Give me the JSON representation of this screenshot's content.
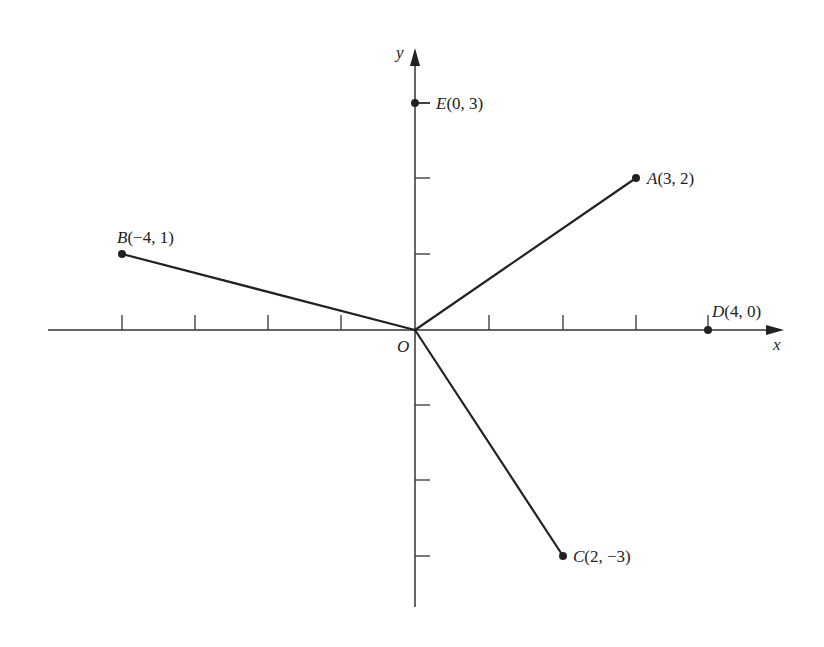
{
  "axes": {
    "x_label": "x",
    "y_label": "y",
    "origin_label": "O"
  },
  "points": [
    {
      "name": "E",
      "x": 0,
      "y": 3,
      "label": "E",
      "coords": "(0, 3)"
    },
    {
      "name": "A",
      "x": 3,
      "y": 2,
      "label": "A",
      "coords": "(3, 2)"
    },
    {
      "name": "B",
      "x": -4,
      "y": 1,
      "label": "B",
      "coords": "(−4, 1)"
    },
    {
      "name": "D",
      "x": 4,
      "y": 0,
      "label": "D",
      "coords": "(4, 0)"
    },
    {
      "name": "C",
      "x": 2,
      "y": -3,
      "label": "C",
      "coords": "(2, −3)"
    }
  ],
  "segments": [
    {
      "from": "O",
      "to": "A"
    },
    {
      "from": "O",
      "to": "B"
    },
    {
      "from": "O",
      "to": "C"
    }
  ],
  "ticks": {
    "x": [
      -4,
      -3,
      -2,
      -1,
      1,
      2,
      3
    ],
    "y": [
      -3,
      -2,
      -1,
      1,
      2
    ]
  },
  "colors": {
    "line": "#222222",
    "axis": "#333333",
    "background": "#ffffff"
  }
}
